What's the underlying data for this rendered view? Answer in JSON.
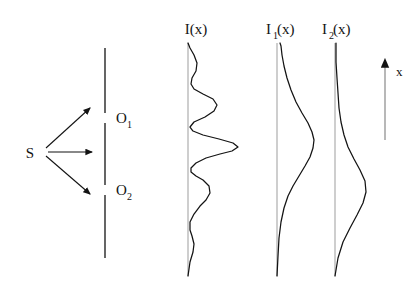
{
  "figure": {
    "background_color": "#ffffff",
    "stroke_color": "#131313",
    "axis_color": "#b9b9b9",
    "width": 419,
    "height": 286
  },
  "source": {
    "label": "S",
    "x": 34,
    "y": 152,
    "ray_count": 3,
    "rays": [
      {
        "name": "ray-upper",
        "from_x": 44,
        "from_y": 148,
        "to_x": 94,
        "to_y": 105
      },
      {
        "name": "ray-middle",
        "from_x": 46,
        "from_y": 152,
        "to_x": 96,
        "to_y": 152
      },
      {
        "name": "ray-lower",
        "from_x": 44,
        "from_y": 156,
        "to_x": 94,
        "to_y": 196
      }
    ]
  },
  "barrier": {
    "name": "slit-barrier",
    "x": 105,
    "top": 48,
    "bottom": 258,
    "segments": [
      {
        "y1": 48,
        "y2": 113
      },
      {
        "y1": 123,
        "y2": 185
      },
      {
        "y1": 195,
        "y2": 258
      }
    ],
    "slits": [
      {
        "label": "O",
        "subscript": "1",
        "label_x": 116,
        "label_y": 122,
        "gap_y1": 113,
        "gap_y2": 123
      },
      {
        "label": "O",
        "subscript": "2",
        "label_x": 116,
        "label_y": 194,
        "gap_y1": 185,
        "gap_y2": 195
      }
    ]
  },
  "axis_arrow": {
    "name": "x-axis-arrow",
    "label": "x",
    "label_x": 398,
    "label_y": 72,
    "x": 385,
    "y_top": 57,
    "y_bottom": 140,
    "direction": "up"
  },
  "plots": [
    {
      "id": "I",
      "label": "I(x)",
      "label_x": 196,
      "label_y": 33,
      "baseline_x": 188,
      "baseline_top": 43,
      "baseline_bottom": 276,
      "curve_name": "intensity-curve-combined",
      "description": "Two-slit interference fringes: central maximum with decaying side lobes"
    },
    {
      "id": "I1",
      "label": "I",
      "label_sub": "1",
      "label_full": "I1(x)",
      "label_x": 268,
      "label_y": 33,
      "baseline_x": 277,
      "baseline_top": 43,
      "baseline_bottom": 276,
      "curve_name": "intensity-curve-slit1",
      "description": "Single broad diffraction hump from slit O1, peak above center"
    },
    {
      "id": "I2",
      "label": "I",
      "label_sub": "2",
      "label_full": "I2(x)",
      "label_x": 324,
      "label_y": 33,
      "baseline_x": 335,
      "baseline_top": 43,
      "baseline_bottom": 276,
      "curve_name": "intensity-curve-slit2",
      "description": "Single broad diffraction hump from slit O2, peak below center"
    }
  ],
  "chart_data": {
    "type": "line",
    "xlabel": "Intensity",
    "ylabel": "x",
    "orientation": "horizontal-intensity-vertical-position",
    "grid": false,
    "legend": "none",
    "axis_ranges": {
      "x_position": [
        43,
        276
      ]
    },
    "series": [
      {
        "name": "I(x)",
        "baseline_x": 188,
        "points": [
          [
            188,
            276
          ],
          [
            190,
            262
          ],
          [
            193,
            252
          ],
          [
            194,
            244
          ],
          [
            192,
            236
          ],
          [
            190,
            230
          ],
          [
            190,
            222
          ],
          [
            194,
            214
          ],
          [
            200,
            206
          ],
          [
            206,
            200
          ],
          [
            210,
            193
          ],
          [
            209,
            186
          ],
          [
            203,
            180
          ],
          [
            196,
            176
          ],
          [
            191,
            172
          ],
          [
            191,
            168
          ],
          [
            196,
            163
          ],
          [
            206,
            158
          ],
          [
            220,
            154
          ],
          [
            232,
            151
          ],
          [
            238,
            147
          ],
          [
            233,
            143
          ],
          [
            219,
            139
          ],
          [
            203,
            135
          ],
          [
            193,
            131
          ],
          [
            190,
            127
          ],
          [
            194,
            122
          ],
          [
            205,
            117
          ],
          [
            214,
            111
          ],
          [
            217,
            105
          ],
          [
            213,
            99
          ],
          [
            203,
            94
          ],
          [
            194,
            89
          ],
          [
            191,
            84
          ],
          [
            192,
            78
          ],
          [
            196,
            71
          ],
          [
            197,
            63
          ],
          [
            194,
            55
          ],
          [
            190,
            48
          ],
          [
            188,
            43
          ]
        ],
        "peaks_x_position": [
          105,
          139,
          175,
          193,
          213,
          244
        ],
        "peak_intensities": [
          217,
          238,
          210,
          194,
          192,
          197
        ],
        "comment": "Interference pattern, central maximum at position y=147"
      },
      {
        "name": "I1(x)",
        "baseline_x": 277,
        "points": [
          [
            277,
            276
          ],
          [
            278,
            256
          ],
          [
            279,
            238
          ],
          [
            281,
            222
          ],
          [
            284,
            208
          ],
          [
            288,
            196
          ],
          [
            293,
            186
          ],
          [
            299,
            176
          ],
          [
            305,
            166
          ],
          [
            310,
            157
          ],
          [
            313,
            148
          ],
          [
            314,
            140
          ],
          [
            312,
            132
          ],
          [
            308,
            123
          ],
          [
            302,
            113
          ],
          [
            296,
            102
          ],
          [
            291,
            90
          ],
          [
            287,
            78
          ],
          [
            284,
            66
          ],
          [
            282,
            55
          ],
          [
            281,
            46
          ],
          [
            280,
            43
          ]
        ],
        "peak_intensity": 314,
        "peak_position": 140,
        "comment": "Single-slit hump from O1"
      },
      {
        "name": "I2(x)",
        "baseline_x": 335,
        "points": [
          [
            335,
            276
          ],
          [
            338,
            258
          ],
          [
            343,
            242
          ],
          [
            350,
            228
          ],
          [
            357,
            215
          ],
          [
            363,
            203
          ],
          [
            366,
            192
          ],
          [
            365,
            181
          ],
          [
            360,
            170
          ],
          [
            354,
            159
          ],
          [
            348,
            147
          ],
          [
            344,
            135
          ],
          [
            341,
            122
          ],
          [
            339,
            108
          ],
          [
            338,
            93
          ],
          [
            337,
            78
          ],
          [
            336,
            62
          ],
          [
            336,
            48
          ],
          [
            336,
            43
          ]
        ],
        "peak_intensity": 366,
        "peak_position": 192,
        "comment": "Single-slit hump from O2"
      }
    ]
  }
}
